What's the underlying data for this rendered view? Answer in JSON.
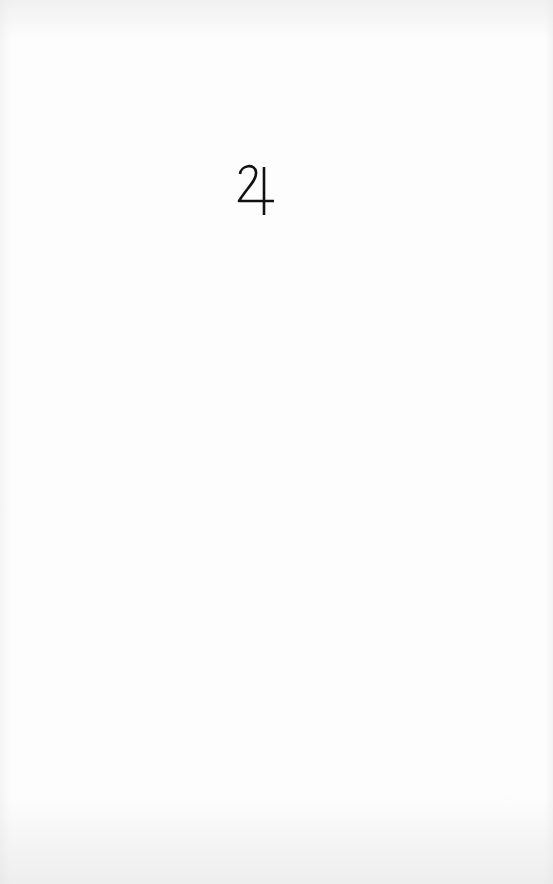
{
  "page": {
    "symbol": {
      "name": "jupiter",
      "glyph": "♃",
      "color": "#111111"
    }
  }
}
